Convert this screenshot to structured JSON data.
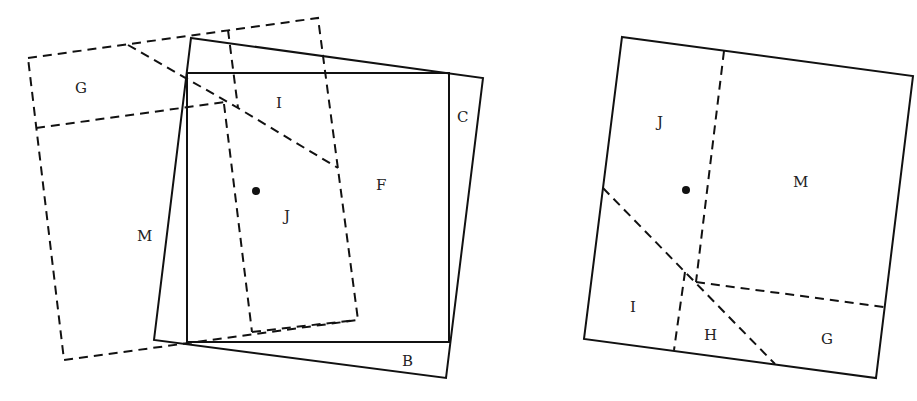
{
  "figure": {
    "left_diagram": {
      "labels": {
        "G": "G",
        "I": "I",
        "C": "C",
        "F": "F",
        "J": "J",
        "M": "M",
        "B": "B"
      }
    },
    "right_diagram": {
      "labels": {
        "J": "J",
        "M": "M",
        "I": "I",
        "H": "H",
        "G": "G"
      }
    },
    "colors": {
      "stroke": "#111111",
      "background": "#ffffff"
    }
  }
}
